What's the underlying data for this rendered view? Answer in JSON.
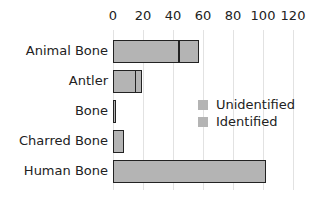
{
  "chart_data": {
    "type": "bar",
    "orientation": "horizontal",
    "stacked": true,
    "title": "",
    "xlabel": "",
    "ylabel": "",
    "xlim": [
      0,
      120
    ],
    "x_ticks": [
      "0",
      "20",
      "40",
      "60",
      "80",
      "100",
      "120"
    ],
    "grid": true,
    "legend_position": "right-center",
    "categories": [
      "Animal Bone",
      "Antler",
      "Bone",
      "Charred Bone",
      "Human Bone"
    ],
    "series": [
      {
        "name": "Identified",
        "color": "#b4b4b4",
        "values": [
          44,
          15,
          2,
          7,
          102
        ]
      },
      {
        "name": "Unidentified",
        "color": "#b4b4b4",
        "values": [
          13,
          4,
          0,
          0,
          0
        ]
      }
    ],
    "legend": [
      "Unidentified",
      "Identified"
    ]
  }
}
